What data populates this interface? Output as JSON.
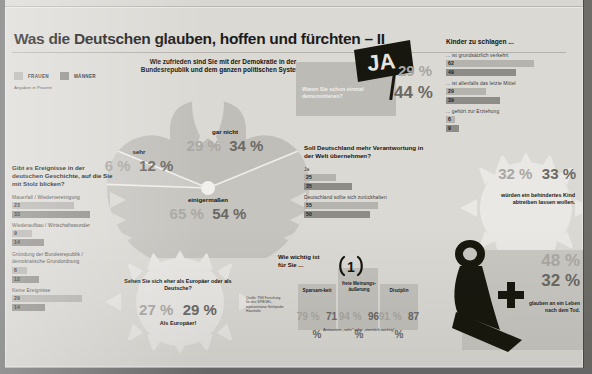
{
  "header": {
    "title": "Was die Deutschen glauben, hoffen und fürchten  –  II",
    "legend": {
      "women": "FRAUEN",
      "men": "MÄNNER"
    },
    "note": "Angaben in Prozent"
  },
  "colors": {
    "women": "#b5b3ae",
    "men": "#8e8c87",
    "background": "#dbd9d4",
    "ink": "#1b1b1b"
  },
  "democracy": {
    "question": "Wie zufrieden sind Sie mit der Demokratie in der Bundesrepublik und dem ganzen politischen System?",
    "segments": [
      {
        "label": "gar nicht",
        "women": "29 %",
        "men": "34 %"
      },
      {
        "label": "sehr",
        "women": "6 %",
        "men": "12 %"
      },
      {
        "label": "einigermaßen",
        "women": "65 %",
        "men": "54 %"
      }
    ]
  },
  "history": {
    "question": "Gibt es Ereignisse in der deutschen Geschichte, auf die Sie mit Stolz blicken?",
    "items": [
      {
        "label": "Mauerfall / Wiedervereinigung",
        "women": "23",
        "men": "33"
      },
      {
        "label": "Wiederaufbau / Wirtschaftswunder",
        "women": "9",
        "men": "14"
      },
      {
        "label": "Gründung der Bundesrepublik / demokratische Grundordnung",
        "women": "6",
        "men": "12"
      },
      {
        "label": "Keine Ereignisse",
        "women": "29",
        "men": "14"
      }
    ]
  },
  "europe": {
    "question": "Sehen Sie sich eher als Europäer oder als Deutsche?",
    "women": "27 %",
    "men": "29 %",
    "answer": "Als Europäer!"
  },
  "demonstrate": {
    "question": "Waren Sie schon einmal demonstrieren?",
    "sign": "JA",
    "women": "29 %",
    "men": "44 %"
  },
  "responsibility": {
    "question": "Soll Deutschland mehr Verantwortung in der Welt übernehmen?",
    "items": [
      {
        "label": "Ja",
        "women": "25",
        "men": "35"
      },
      {
        "label": "Deutschland sollte sich zurückhalten",
        "women": "55",
        "men": "50"
      }
    ]
  },
  "children": {
    "question": "Kinder zu schlagen ...",
    "items": [
      {
        "label": "... ist grundsätzlich verkehrt",
        "women": "62",
        "men": "49"
      },
      {
        "label": "... ist allenfalls das letzte Mittel",
        "women": "29",
        "men": "39"
      },
      {
        "label": "... gehört zur Erziehung",
        "women": "6",
        "men": "9"
      }
    ]
  },
  "abortion": {
    "women": "32 %",
    "men": "33 %",
    "text": "würden ein behindertes Kind abtreiben lassen wollen."
  },
  "important": {
    "question": "Wie wichtig ist für Sie ...",
    "rank": "1",
    "columns": [
      {
        "label": "Sparsam-keit",
        "women": "79 %",
        "men": "71 %"
      },
      {
        "label": "freie Meinungs-äußerung",
        "women": "94 %",
        "men": "96 %"
      },
      {
        "label": "Disziplin",
        "women": "91 %",
        "men": "87 %"
      }
    ],
    "footnote": "Antworten „sehr“ oder „ziemlich wichtig“"
  },
  "afterlife": {
    "women": "48 %",
    "men": "32 %",
    "text": "glauben an ein Leben nach dem Tod."
  },
  "source": "Quelle: TNS Forschung für den SPIEGEL, repräsentative Stichprobe Haushalte"
}
